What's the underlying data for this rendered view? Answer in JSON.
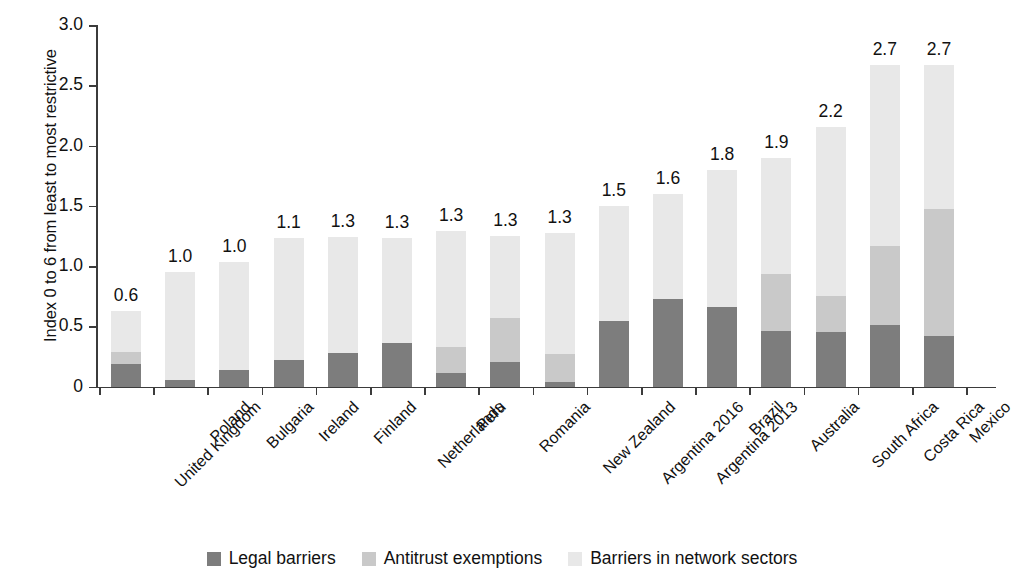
{
  "chart_data": {
    "type": "bar",
    "subtype": "stacked-bar",
    "title": "",
    "xlabel": "",
    "ylabel": "Index 0 to 6 from least to most restrictive",
    "ylim": [
      0,
      3.0
    ],
    "yticks": [
      "0",
      "0.5",
      "1.0",
      "1.5",
      "2.0",
      "2.5",
      "3.0"
    ],
    "ytick_values": [
      0,
      0.5,
      1.0,
      1.5,
      2.0,
      2.5,
      3.0
    ],
    "grid": false,
    "legend_position": "bottom-center",
    "categories": [
      "United Kingdom",
      "Poland",
      "Bulgaria",
      "Ireland",
      "Finland",
      "Netherlands",
      "Peru",
      "Romania",
      "New Zealand",
      "Argentina 2016",
      "Argentina 2013",
      "Brazil",
      "Australia",
      "South Africa",
      "Costa Rica",
      "Mexico"
    ],
    "series": [
      {
        "name": "Legal barriers",
        "color": "#7d7d7d",
        "values": [
          0.19,
          0.05,
          0.14,
          0.22,
          0.28,
          0.36,
          0.11,
          0.2,
          0.04,
          0.54,
          0.73,
          0.66,
          0.46,
          0.45,
          0.51,
          0.42
        ]
      },
      {
        "name": "Antitrust exemptions",
        "color": "#c9c9c9",
        "values": [
          0.1,
          0.0,
          0.0,
          0.0,
          0.0,
          0.0,
          0.22,
          0.37,
          0.23,
          0.0,
          0.0,
          0.0,
          0.47,
          0.3,
          0.66,
          1.05
        ]
      },
      {
        "name": "Barriers in network sectors",
        "color": "#e8e8e8",
        "values": [
          0.34,
          0.9,
          0.89,
          1.01,
          0.96,
          0.87,
          0.96,
          0.68,
          1.0,
          0.96,
          0.87,
          1.14,
          0.97,
          1.4,
          1.5,
          1.2
        ]
      }
    ],
    "totals": [
      0.63,
      0.95,
      1.03,
      1.23,
      1.24,
      1.23,
      1.29,
      1.25,
      1.27,
      1.5,
      1.6,
      1.8,
      1.9,
      2.15,
      2.67,
      2.67
    ],
    "value_labels": [
      "0.6",
      "1.0",
      "1.0",
      "1.1",
      "1.3",
      "1.3",
      "1.3",
      "1.3",
      "1.3",
      "1.5",
      "1.6",
      "1.8",
      "1.9",
      "2.2",
      "2.7",
      "2.7"
    ]
  },
  "legend": {
    "items": [
      {
        "label": "Legal barriers",
        "color": "#7d7d7d"
      },
      {
        "label": "Antitrust exemptions",
        "color": "#c9c9c9"
      },
      {
        "label": "Barriers in network sectors",
        "color": "#e8e8e8"
      }
    ]
  }
}
